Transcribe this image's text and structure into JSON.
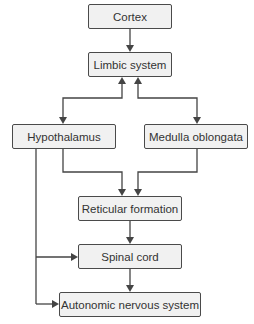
{
  "diagram": {
    "title": "",
    "nodes": [
      {
        "id": "cortex",
        "label": "Cortex"
      },
      {
        "id": "limbic",
        "label": "Limbic system"
      },
      {
        "id": "hypothalamus",
        "label": "Hypothalamus"
      },
      {
        "id": "medulla",
        "label": "Medulla oblongata"
      },
      {
        "id": "reticular",
        "label": "Reticular formation"
      },
      {
        "id": "spinal",
        "label": "Spinal cord"
      },
      {
        "id": "ans",
        "label": "Autonomic nervous system"
      }
    ],
    "edges": [
      {
        "from": "cortex",
        "to": "limbic"
      },
      {
        "from": "limbic",
        "to": "hypothalamus",
        "bidirectional": true
      },
      {
        "from": "limbic",
        "to": "medulla",
        "bidirectional": true
      },
      {
        "from": "hypothalamus",
        "to": "reticular"
      },
      {
        "from": "medulla",
        "to": "reticular"
      },
      {
        "from": "reticular",
        "to": "spinal"
      },
      {
        "from": "spinal",
        "to": "ans"
      },
      {
        "from": "hypothalamus",
        "to": "spinal"
      },
      {
        "from": "hypothalamus",
        "to": "ans"
      }
    ],
    "colors": {
      "box_fill": "#f1f1f1",
      "box_border": "#4a4a4a",
      "line": "#444444",
      "text": "#333333"
    }
  }
}
